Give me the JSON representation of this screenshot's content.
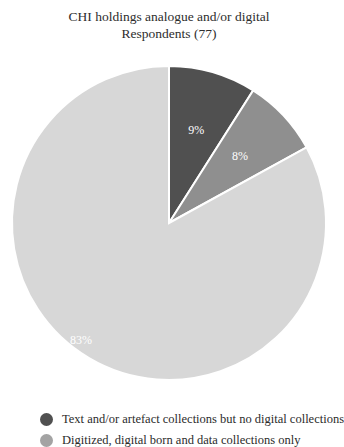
{
  "chart_data": {
    "type": "pie",
    "title": "CHI holdings analogue and/or digital",
    "subtitle": "Respondents (77)",
    "slices": [
      {
        "label": "Text and/or artefact collections but no digital collections",
        "value": 9,
        "value_label": "9%",
        "color": "#505050"
      },
      {
        "label": "Digitized, digital born and data collections only",
        "value": 8,
        "value_label": "8%",
        "color": "#8f8f8f"
      },
      {
        "label": "",
        "value": 83,
        "value_label": "83%",
        "color": "#d7d7d7"
      }
    ],
    "start_angle": "12 o'clock",
    "direction": "clockwise",
    "legend": {
      "placement": "bottom",
      "entries": [
        {
          "label": "Text and/or artefact collections but no digital collections",
          "color": "#505050"
        },
        {
          "label": "Digitized, digital born and data collections only",
          "color": "#a3a3a3"
        }
      ]
    }
  }
}
